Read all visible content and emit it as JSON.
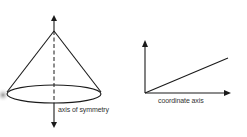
{
  "diagrams": [
    {
      "name": "cone",
      "label": "axis of symmetry"
    },
    {
      "name": "coordinate-system",
      "label": "coordinate axis"
    }
  ],
  "colors": {
    "stroke": "#1a1a1a",
    "label": "#333333",
    "smudge": "#9a9a9a"
  }
}
